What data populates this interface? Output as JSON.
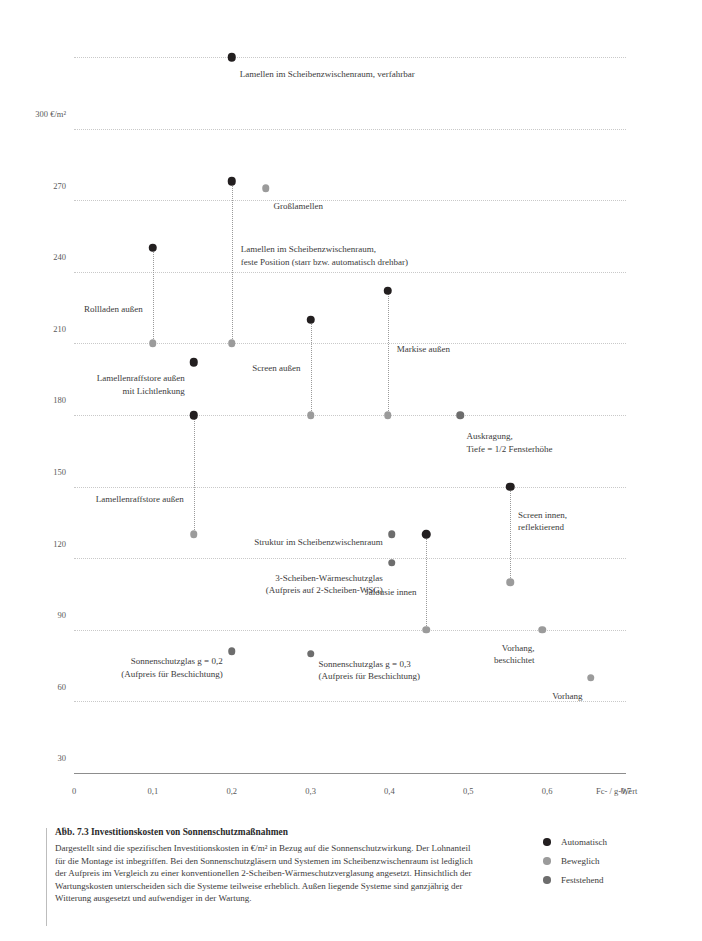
{
  "figure": {
    "caption_title": "Abb. 7.3 Investitionskosten von Sonnenschutzmaßnahmen",
    "caption_body": "Dargestellt sind die spezifischen Investitionskosten in €/m² in Bezug auf die Sonnenschutzwirkung. Der Lohnanteil für die Montage ist inbegriffen. Bei den Sonnenschutzgläsern und Systemen im Scheibenzwischenraum ist lediglich der Aufpreis im Vergleich zu einer konventionellen 2-Scheiben-Wärmeschutzverglasung angesetzt. Hinsichtlich der Wartungskosten unterscheiden sich die Systeme teilweise erheblich. Außen liegende Systeme sind ganzjährig der Witterung ausgesetzt und aufwendiger in der Wartung."
  },
  "legend": {
    "position": "bottom-right",
    "items": [
      {
        "label": "Automatisch",
        "color": "#231f20",
        "key": "automatisch"
      },
      {
        "label": "Beweglich",
        "color": "#9b9b9b",
        "key": "beweglich"
      },
      {
        "label": "Feststehend",
        "color": "#6d6d6d",
        "key": "feststehend"
      }
    ]
  },
  "chart_data": {
    "type": "scatter",
    "title": "Abb. 7.3 Investitionskosten von Sonnenschutzmaßnahmen",
    "xlabel": "Fc- / g-Wert",
    "ylabel": "300 €/m²",
    "y_unit": "€/m²",
    "xlim": [
      0,
      0.7
    ],
    "ylim": [
      0,
      300
    ],
    "grid": true,
    "xticks": [
      "0",
      "0,1",
      "0,2",
      "0,3",
      "0,4",
      "0,5",
      "0,6",
      "0,7"
    ],
    "xtick_values": [
      0,
      0.1,
      0.2,
      0.3,
      0.4,
      0.5,
      0.6,
      0.7
    ],
    "yticks": [
      "0",
      "30",
      "60",
      "90",
      "120",
      "150",
      "180",
      "210",
      "240",
      "270",
      "300 €/m²"
    ],
    "ytick_values": [
      0,
      30,
      60,
      90,
      120,
      150,
      180,
      210,
      240,
      270,
      300
    ],
    "series": [
      {
        "name": "Automatisch",
        "color": "#231f20"
      },
      {
        "name": "Beweglich",
        "color": "#9b9b9b"
      },
      {
        "name": "Feststehend",
        "color": "#6d6d6d"
      }
    ],
    "points": [
      {
        "label": "Lamellen im Scheibenzwischenraum, verfahrbar",
        "label_lines": [
          "Lamellen im Scheibenzwischenraum, verfahrbar"
        ],
        "x": 0.2,
        "y": 300,
        "category": "automatisch",
        "label_anchor": "right",
        "label_dx": 8,
        "label_dy": 11
      },
      {
        "label": "Lamellen im Scheibenzwischenraum, feste Position (starr bzw. automatisch drehbar)",
        "label_lines": [
          "Lamellen im Scheibenzwischenraum,",
          "feste Position (starr bzw. automatisch drehbar)"
        ],
        "x": 0.2,
        "y": 248,
        "y_low": 180,
        "category": "automatisch",
        "category_low": "beweglich",
        "label_anchor": "right",
        "label_dx": 9,
        "label_dy": 62
      },
      {
        "label": "Großlamellen",
        "label_lines": [
          "Großlamellen"
        ],
        "x": 0.243,
        "y": 245,
        "category": "beweglich",
        "label_anchor": "right",
        "label_dx": 8,
        "label_dy": 12
      },
      {
        "label": "Rollladen außen",
        "label_lines": [
          "Rollladen außen"
        ],
        "x": 0.1,
        "y": 220,
        "y_low": 180,
        "category": "automatisch",
        "category_low": "beweglich",
        "label_anchor": "left",
        "label_dx": -10,
        "label_dy": 55
      },
      {
        "label": "Lamellenraffstore außen mit Lichtlenkung",
        "label_lines": [
          "Lamellenraffstore außen",
          "mit Lichtlenkung"
        ],
        "x": 0.152,
        "y": 172,
        "category": "automatisch",
        "label_anchor": "left",
        "label_dx": -9,
        "label_dy": 10
      },
      {
        "label": "Lamellenraffstore außen",
        "label_lines": [
          "Lamellenraffstore außen"
        ],
        "x": 0.152,
        "y": 150,
        "y_low": 100,
        "category": "automatisch",
        "category_low": "beweglich",
        "label_anchor": "left",
        "label_dx": -10,
        "label_dy": 78
      },
      {
        "label": "Screen außen",
        "label_lines": [
          "Screen außen"
        ],
        "x": 0.3,
        "y": 190,
        "y_low": 150,
        "category": "automatisch",
        "category_low": "beweglich",
        "label_anchor": "left",
        "label_dx": -10,
        "label_dy": 42
      },
      {
        "label": "Markise außen",
        "label_lines": [
          "Markise außen"
        ],
        "x": 0.398,
        "y": 202,
        "y_low": 150,
        "category": "automatisch",
        "category_low": "beweglich",
        "label_anchor": "right",
        "label_dx": 9,
        "label_dy": 52
      },
      {
        "label": "Auskragung, Tiefe = 1/2 Fensterhöhe",
        "label_lines": [
          "Auskragung,",
          "Tiefe = 1/2 Fensterhöhe"
        ],
        "x": 0.49,
        "y": 150,
        "category": "feststehend",
        "label_anchor": "right",
        "label_dx": 6,
        "label_dy": 15
      },
      {
        "label": "Struktur im Scheibenzwischenraum",
        "label_lines": [
          "Struktur im Scheibenzwischenraum"
        ],
        "x": 0.403,
        "y": 100,
        "category": "feststehend",
        "label_anchor": "left",
        "label_dx": -9,
        "label_dy": 2
      },
      {
        "label": "3-Scheiben-Wärmeschutzglas (Aufpreis auf 2-Scheiben-WSG)",
        "label_lines": [
          "3-Scheiben-Wärmeschutzglas",
          "(Aufpreis auf 2-Scheiben-WSG)"
        ],
        "x": 0.403,
        "y": 88,
        "category": "feststehend",
        "label_anchor": "left",
        "label_dx": -9,
        "label_dy": 9
      },
      {
        "label": "Jalousie innen",
        "label_lines": [
          "Jalousie innen"
        ],
        "x": 0.447,
        "y": 100,
        "y_low": 60,
        "category": "automatisch",
        "category_low": "beweglich",
        "label_anchor": "left",
        "label_dx": -10,
        "label_dy": 52
      },
      {
        "label": "Screen innen, reflektierend",
        "label_lines": [
          "Screen innen,",
          "reflektierend"
        ],
        "x": 0.553,
        "y": 120,
        "y_low": 80,
        "category": "automatisch",
        "category_low": "beweglich",
        "label_anchor": "right",
        "label_dx": 8,
        "label_dy": 22
      },
      {
        "label": "Sonnenschutzglas g = 0,2 (Aufpreis für Beschichtung)",
        "label_lines": [
          "Sonnenschutzglas g = 0,2",
          "(Aufpreis für Beschichtung)"
        ],
        "x": 0.2,
        "y": 51,
        "category": "feststehend",
        "label_anchor": "left",
        "label_dx": -9,
        "label_dy": 4
      },
      {
        "label": "Sonnenschutzglas g = 0,3 (Aufpreis für Beschichtung)",
        "label_lines": [
          "Sonnenschutzglas g = 0,3",
          "(Aufpreis für Beschichtung)"
        ],
        "x": 0.3,
        "y": 50,
        "category": "feststehend",
        "label_anchor": "right",
        "label_dx": 8,
        "label_dy": 4
      },
      {
        "label": "Vorhang, beschichtet",
        "label_lines": [
          "Vorhang,",
          "beschichtet"
        ],
        "x": 0.594,
        "y": 60,
        "category": "beweglich",
        "label_anchor": "left",
        "label_dx": -8,
        "label_dy": 12
      },
      {
        "label": "Vorhang",
        "label_lines": [
          "Vorhang"
        ],
        "x": 0.655,
        "y": 40,
        "category": "beweglich",
        "label_anchor": "left",
        "label_dx": -8,
        "label_dy": 12
      }
    ]
  }
}
